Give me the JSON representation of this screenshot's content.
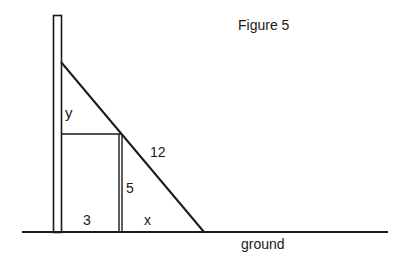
{
  "figure": {
    "title": "Figure 5",
    "labels": {
      "y": "y",
      "hypotenuse": "12",
      "post_height": "5",
      "base_left": "3",
      "base_right": "x",
      "ground": "ground"
    },
    "stroke_color": "#1a1a1a",
    "background": "#ffffff"
  }
}
